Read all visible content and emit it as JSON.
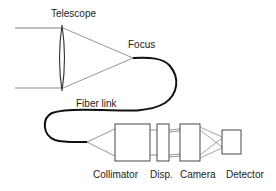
{
  "diagram": {
    "labels": {
      "telescope": "Telescope",
      "focus": "Focus",
      "fiber_link": "Fiber link",
      "collimator": "Collimator",
      "disperser": "Disp.",
      "camera": "Camera",
      "detector": "Detector"
    },
    "colors": {
      "line": "#555555",
      "fiber": "#111111",
      "text": "#222222",
      "background": "#ffffff"
    }
  }
}
